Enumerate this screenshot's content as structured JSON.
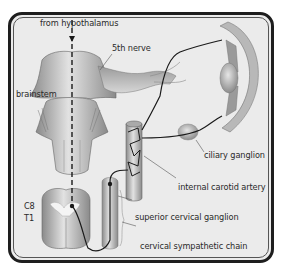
{
  "figure": {
    "labels": {
      "from_hypothalamus": "from hypothalamus",
      "fifth_nerve": "5th nerve",
      "brainstem": "brainstem",
      "ciliary_ganglion": "ciliary ganglion",
      "internal_carotid_artery": "internal carotid artery",
      "c8": "C8",
      "t1": "T1",
      "superior_cervical_ganglion": "superior cervical ganglion",
      "cervical_sympathetic_chain": "cervical sympathetic chain"
    },
    "colors": {
      "background": "#ebebeb",
      "frame": "#1e1e1e",
      "tissue_dark": "#8a8a8a",
      "tissue_light": "#d8d8d8",
      "nerve_line": "#1a1a1a"
    }
  }
}
